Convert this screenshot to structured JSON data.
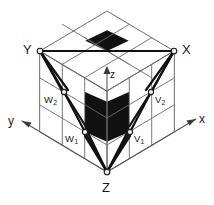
{
  "figure": {
    "type": "isometric-cube-diagram",
    "colors": {
      "background": "#ffffff",
      "grid_line": "#6b6b6b",
      "heavy_line": "#111111",
      "shaded_cell": "#111111",
      "node_fill": "#ededed",
      "node_stroke": "#1a1a1a",
      "text": "#1a1a1a"
    },
    "cube": {
      "divisions": 3,
      "faces": [
        "top",
        "left",
        "right"
      ]
    }
  },
  "labels": {
    "corner_Y": "Y",
    "corner_X": "X",
    "corner_Z": "Z",
    "axis_x": "x",
    "axis_y": "y",
    "axis_z": "z",
    "vertex_w2_base": "W",
    "vertex_w2_sub": "2",
    "vertex_v2_base": "V",
    "vertex_v2_sub": "2",
    "vertex_w1_base": "W",
    "vertex_w1_sub": "1",
    "vertex_v1_base": "V",
    "vertex_v1_sub": "1"
  },
  "nodes": [
    {
      "name": "Y",
      "x": 40,
      "y": 51
    },
    {
      "name": "X",
      "x": 174,
      "y": 51
    },
    {
      "name": "Z",
      "x": 107,
      "y": 172
    },
    {
      "name": "W2",
      "x": 64,
      "y": 92
    },
    {
      "name": "V2",
      "x": 151,
      "y": 92
    },
    {
      "name": "W1",
      "x": 85,
      "y": 132
    },
    {
      "name": "V1",
      "x": 130,
      "y": 132
    }
  ],
  "shaded_cells": [
    {
      "face": "top",
      "cell": "center"
    },
    {
      "face": "left",
      "cell": "middle-front"
    },
    {
      "face": "right",
      "cell": "middle-front"
    }
  ],
  "axes": {
    "x": {
      "direction": "right",
      "arrow": true
    },
    "y": {
      "direction": "left",
      "arrow": true
    },
    "z": {
      "direction": "up",
      "arrow": true
    }
  }
}
